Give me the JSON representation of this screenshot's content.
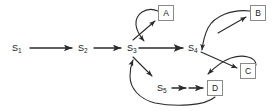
{
  "diagram": {
    "type": "state-transition-flow",
    "stroke_color": "#2b2b2b",
    "box_border_color": "#8a8a8a",
    "background_color": "#ffffff",
    "state_nodes": [
      {
        "id": "s1",
        "label": "S",
        "sub": "1",
        "x": 12,
        "y": 44
      },
      {
        "id": "s2",
        "label": "S",
        "sub": "2",
        "x": 78,
        "y": 44
      },
      {
        "id": "s3",
        "label": "S",
        "sub": "3",
        "x": 127,
        "y": 44
      },
      {
        "id": "s4",
        "label": "S",
        "sub": "4",
        "x": 188,
        "y": 44
      },
      {
        "id": "s5",
        "label": "S",
        "sub": "5",
        "x": 157,
        "y": 84
      }
    ],
    "box_nodes": [
      {
        "id": "a",
        "label": "A",
        "x": 158,
        "y": 5
      },
      {
        "id": "b",
        "label": "B",
        "x": 250,
        "y": 5
      },
      {
        "id": "c",
        "label": "C",
        "x": 240,
        "y": 63
      },
      {
        "id": "d",
        "label": "D",
        "x": 207,
        "y": 80
      }
    ],
    "edges": [
      {
        "from": "s1",
        "to": "s2",
        "kind": "straight-arrow"
      },
      {
        "from": "s2",
        "to": "s3",
        "kind": "straight-arrow"
      },
      {
        "from": "s3",
        "to": "s4",
        "kind": "straight-arrow"
      },
      {
        "from": "s3",
        "to": "a",
        "kind": "diagonal-arrow"
      },
      {
        "from": "a",
        "to": "s3",
        "kind": "curved-feedback-arrow"
      },
      {
        "from": "s3",
        "to": "s5",
        "kind": "diagonal-arrow"
      },
      {
        "from": "s5",
        "to": "d",
        "kind": "double-arrow-chain"
      },
      {
        "from": "d",
        "to": "s3",
        "kind": "curved-feedback-arrow"
      },
      {
        "from": "s4",
        "to": "b",
        "kind": "diagonal-arrow"
      },
      {
        "from": "b",
        "to": "s4",
        "kind": "curved-feedback-arrow"
      },
      {
        "from": "s4",
        "to": "c",
        "kind": "diagonal-arrow"
      },
      {
        "from": "c",
        "to": "s4",
        "kind": "curved-feedback-arrow"
      }
    ]
  }
}
